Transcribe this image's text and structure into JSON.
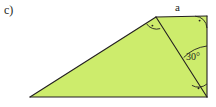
{
  "figure": {
    "part_label": "c)",
    "colors": {
      "fill": "#cdec6c",
      "stroke": "#231f20",
      "background": "#ffffff"
    },
    "labels": {
      "side_top": "a",
      "angle_interior": "30°"
    },
    "markers": {
      "right_angle_top_vertex": "right-angle-mark",
      "right_angle_top_right": "right-angle-mark",
      "right_angle_bottom_right": "right-angle-mark"
    },
    "geometry": {
      "vertices": {
        "bottom_left": [
          30,
          97
        ],
        "apex": [
          156,
          17
        ],
        "top_right": [
          207,
          16
        ],
        "bottom_right": [
          207,
          97
        ]
      },
      "large_triangle": "30,97 156,17 207,97",
      "small_triangle": "156,17 207,16 207,97",
      "interior_diagonal": "156,17 207,97"
    }
  }
}
